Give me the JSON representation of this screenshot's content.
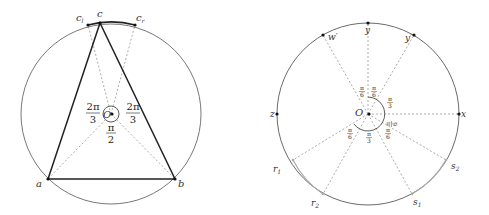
{
  "left_figure": {
    "labels": {
      "c": "c",
      "c_l": "c",
      "c_l_sub": "l",
      "c_r": "c",
      "c_r_sub": "r",
      "a": "a",
      "b": "b",
      "O": "O"
    },
    "angles": {
      "left_num": "2π",
      "left_den": "3",
      "right_num": "2π",
      "right_den": "3",
      "bottom_num": "π",
      "bottom_den": "2"
    }
  },
  "right_figure": {
    "labels": {
      "y": "y",
      "w_prime": "w′",
      "y_prime": "y′",
      "z": "z",
      "x": "x",
      "O": "O",
      "r1": "r",
      "r1_sub": "1",
      "r2": "r",
      "r2_sub": "2",
      "s1": "s",
      "s1_sub": "1",
      "s2": "s",
      "s2_sub": "2"
    },
    "angles": {
      "a1_num": "π",
      "a1_den": "6",
      "a2_num": "π",
      "a2_den": "6",
      "a3_num": "π",
      "a3_den": "3",
      "a4_num": "π",
      "a4_den": "6",
      "a5_num": "π",
      "a5_den": "6",
      "a6_num": "π",
      "a6_den": "3",
      "a7_num": "π",
      "a7_den": "6"
    }
  },
  "colors": {
    "stroke": "#222222",
    "circle": "#555555",
    "dashed": "#888888",
    "highlight_arc": "#aaaaaa"
  }
}
